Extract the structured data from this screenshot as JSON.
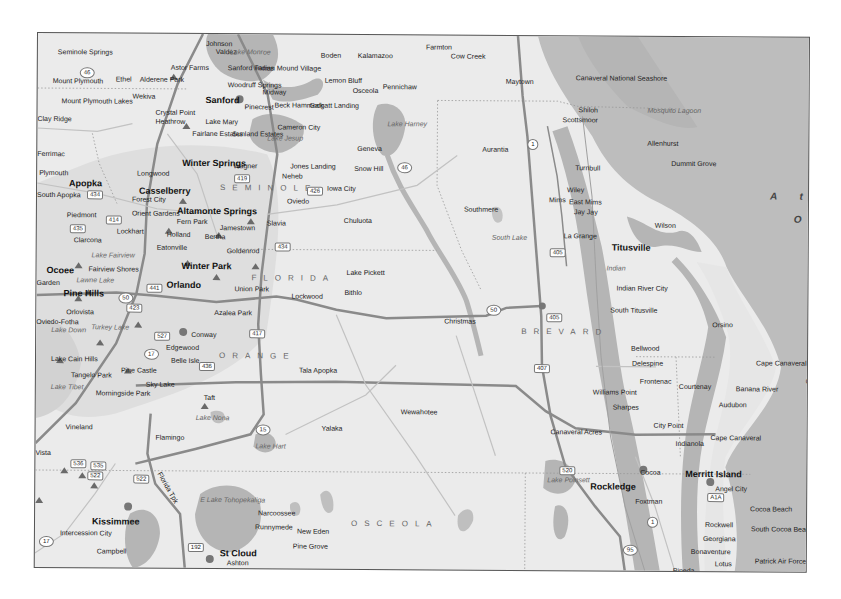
{
  "map": {
    "state_label": "FLORIDA",
    "counties": [
      {
        "name": "SEMINOLE",
        "x": 183,
        "y": 150
      },
      {
        "name": "ORANGE",
        "x": 183,
        "y": 318
      },
      {
        "name": "OSCEOLA",
        "x": 316,
        "y": 485
      },
      {
        "name": "BREVARD",
        "x": 485,
        "y": 292
      }
    ],
    "ocean_labels": [
      {
        "text": "A t l",
        "x": 733,
        "y": 155
      },
      {
        "text": "O",
        "x": 757,
        "y": 178
      }
    ],
    "cities": [
      {
        "name": "Seminole Springs",
        "x": 20,
        "y": 15,
        "bold": false
      },
      {
        "name": "Johnson",
        "x": 168,
        "y": 6,
        "bold": false
      },
      {
        "name": "Valdez",
        "x": 178,
        "y": 14,
        "bold": false
      },
      {
        "name": "Astor Farms",
        "x": 133,
        "y": 30,
        "bold": false
      },
      {
        "name": "Sanford Farms",
        "x": 190,
        "y": 30,
        "bold": false
      },
      {
        "name": "Indian Mound Village",
        "x": 218,
        "y": 30,
        "bold": false
      },
      {
        "name": "Boden",
        "x": 283,
        "y": 17,
        "bold": false
      },
      {
        "name": "Kalamazoo",
        "x": 320,
        "y": 17,
        "bold": false
      },
      {
        "name": "Farmton",
        "x": 388,
        "y": 8,
        "bold": false
      },
      {
        "name": "Cow Creek",
        "x": 413,
        "y": 17,
        "bold": false
      },
      {
        "name": "Mount Plymouth",
        "x": 15,
        "y": 44,
        "bold": false
      },
      {
        "name": "Ethel",
        "x": 78,
        "y": 42,
        "bold": false
      },
      {
        "name": "Alderene Park",
        "x": 102,
        "y": 42,
        "bold": false
      },
      {
        "name": "Woodruff Springs",
        "x": 190,
        "y": 47,
        "bold": false
      },
      {
        "name": "Lemon Bluff",
        "x": 287,
        "y": 42,
        "bold": false
      },
      {
        "name": "Osceola",
        "x": 315,
        "y": 52,
        "bold": false
      },
      {
        "name": "Pennichaw",
        "x": 345,
        "y": 48,
        "bold": false
      },
      {
        "name": "Maytown",
        "x": 468,
        "y": 42,
        "bold": false
      },
      {
        "name": "Mount Plymouth Lakes",
        "x": 24,
        "y": 64,
        "bold": false
      },
      {
        "name": "Wekiva",
        "x": 95,
        "y": 59,
        "bold": false
      },
      {
        "name": "Sanford",
        "x": 168,
        "y": 61,
        "bold": true
      },
      {
        "name": "Midway",
        "x": 225,
        "y": 54,
        "bold": false
      },
      {
        "name": "Pinecrest",
        "x": 207,
        "y": 69,
        "bold": false
      },
      {
        "name": "Beck Hammock",
        "x": 237,
        "y": 67,
        "bold": false
      },
      {
        "name": "Galgatt Landing",
        "x": 272,
        "y": 67,
        "bold": false
      },
      {
        "name": "Canaveral National Seashore",
        "x": 538,
        "y": 38,
        "bold": false
      },
      {
        "name": "Shiloh",
        "x": 541,
        "y": 70,
        "bold": false
      },
      {
        "name": "Scottsmoor",
        "x": 525,
        "y": 80,
        "bold": false
      },
      {
        "name": "Clay Ridge",
        "x": 0,
        "y": 82,
        "bold": false
      },
      {
        "name": "Crystal Point",
        "x": 118,
        "y": 75,
        "bold": false
      },
      {
        "name": "Heathrow",
        "x": 118,
        "y": 84,
        "bold": false
      },
      {
        "name": "Lake Mary",
        "x": 168,
        "y": 84,
        "bold": false
      },
      {
        "name": "Cameron City",
        "x": 240,
        "y": 89,
        "bold": false
      },
      {
        "name": "Fairlane Estates",
        "x": 155,
        "y": 96,
        "bold": false
      },
      {
        "name": "Sunland Estates",
        "x": 195,
        "y": 96,
        "bold": false
      },
      {
        "name": "Geneva",
        "x": 320,
        "y": 110,
        "bold": false
      },
      {
        "name": "Aurantia",
        "x": 445,
        "y": 110,
        "bold": false
      },
      {
        "name": "Allenhurst",
        "x": 610,
        "y": 103,
        "bold": false
      },
      {
        "name": "Dummit Grove",
        "x": 634,
        "y": 123,
        "bold": false
      },
      {
        "name": "Ferrimac",
        "x": 0,
        "y": 117,
        "bold": false
      },
      {
        "name": "Winter Springs",
        "x": 145,
        "y": 124,
        "bold": true
      },
      {
        "name": "Wagner",
        "x": 196,
        "y": 128,
        "bold": false
      },
      {
        "name": "Jones Landing",
        "x": 253,
        "y": 128,
        "bold": false
      },
      {
        "name": "Snow Hill",
        "x": 317,
        "y": 130,
        "bold": false
      },
      {
        "name": "Turnbull",
        "x": 538,
        "y": 128,
        "bold": false
      },
      {
        "name": "Plymouth",
        "x": 2,
        "y": 136,
        "bold": false
      },
      {
        "name": "Longwood",
        "x": 100,
        "y": 136,
        "bold": false
      },
      {
        "name": "Neheb",
        "x": 245,
        "y": 138,
        "bold": false
      },
      {
        "name": "Iowa City",
        "x": 290,
        "y": 150,
        "bold": false
      },
      {
        "name": "Apopka",
        "x": 32,
        "y": 145,
        "bold": true
      },
      {
        "name": "Casselberry",
        "x": 102,
        "y": 152,
        "bold": true
      },
      {
        "name": "South Apopka",
        "x": 0,
        "y": 158,
        "bold": false
      },
      {
        "name": "Forest City",
        "x": 95,
        "y": 162,
        "bold": false
      },
      {
        "name": "Oviedo",
        "x": 250,
        "y": 163,
        "bold": false
      },
      {
        "name": "Chuluota",
        "x": 307,
        "y": 182,
        "bold": false
      },
      {
        "name": "Mims",
        "x": 512,
        "y": 160,
        "bold": false
      },
      {
        "name": "Wiley",
        "x": 530,
        "y": 150,
        "bold": false
      },
      {
        "name": "East Mims",
        "x": 532,
        "y": 162,
        "bold": false
      },
      {
        "name": "Jay Jay",
        "x": 537,
        "y": 172,
        "bold": false
      },
      {
        "name": "Wilson",
        "x": 618,
        "y": 185,
        "bold": false
      },
      {
        "name": "Southmere",
        "x": 427,
        "y": 170,
        "bold": false
      },
      {
        "name": "Altamonte Springs",
        "x": 140,
        "y": 172,
        "bold": true
      },
      {
        "name": "Orient Gardens",
        "x": 95,
        "y": 176,
        "bold": false
      },
      {
        "name": "Piedmont",
        "x": 30,
        "y": 178,
        "bold": false
      },
      {
        "name": "Fern Park",
        "x": 140,
        "y": 184,
        "bold": false
      },
      {
        "name": "Jamestown",
        "x": 183,
        "y": 190,
        "bold": false
      },
      {
        "name": "Slavia",
        "x": 230,
        "y": 185,
        "bold": false
      },
      {
        "name": "La Grange",
        "x": 527,
        "y": 196,
        "bold": false
      },
      {
        "name": "Titusville",
        "x": 575,
        "y": 206,
        "bold": true
      },
      {
        "name": "Lockhart",
        "x": 80,
        "y": 194,
        "bold": false
      },
      {
        "name": "Holland",
        "x": 130,
        "y": 197,
        "bold": false
      },
      {
        "name": "Bertha",
        "x": 168,
        "y": 199,
        "bold": false
      },
      {
        "name": "Clarcona",
        "x": 37,
        "y": 203,
        "bold": false
      },
      {
        "name": "Eatonville",
        "x": 120,
        "y": 210,
        "bold": false
      },
      {
        "name": "Goldenrod",
        "x": 190,
        "y": 213,
        "bold": false
      },
      {
        "name": "Winter Park",
        "x": 145,
        "y": 227,
        "bold": true
      },
      {
        "name": "Ocoee",
        "x": 10,
        "y": 232,
        "bold": true
      },
      {
        "name": "Fairview Shores",
        "x": 52,
        "y": 232,
        "bold": false
      },
      {
        "name": "Lake Pickett",
        "x": 310,
        "y": 234,
        "bold": false
      },
      {
        "name": "Indian River City",
        "x": 580,
        "y": 248,
        "bold": false
      },
      {
        "name": "Garden",
        "x": 0,
        "y": 246,
        "bold": false
      },
      {
        "name": "Orlando",
        "x": 130,
        "y": 246,
        "bold": true
      },
      {
        "name": "Union Park",
        "x": 198,
        "y": 251,
        "bold": false
      },
      {
        "name": "Bithlo",
        "x": 308,
        "y": 254,
        "bold": false
      },
      {
        "name": "Pine Hills",
        "x": 27,
        "y": 255,
        "bold": true
      },
      {
        "name": "Lockwood",
        "x": 255,
        "y": 258,
        "bold": false
      },
      {
        "name": "South Titusville",
        "x": 574,
        "y": 270,
        "bold": false
      },
      {
        "name": "Christmas",
        "x": 408,
        "y": 282,
        "bold": false
      },
      {
        "name": "Orlovista",
        "x": 30,
        "y": 275,
        "bold": false
      },
      {
        "name": "Azalea Park",
        "x": 178,
        "y": 275,
        "bold": false
      },
      {
        "name": "Oviedo-Fotha",
        "x": 0,
        "y": 285,
        "bold": false
      },
      {
        "name": "Orsino",
        "x": 676,
        "y": 284,
        "bold": false
      },
      {
        "name": "Conway",
        "x": 155,
        "y": 297,
        "bold": false
      },
      {
        "name": "Bellwood",
        "x": 595,
        "y": 308,
        "bold": false
      },
      {
        "name": "Edgewood",
        "x": 130,
        "y": 310,
        "bold": false
      },
      {
        "name": "Lake Cain Hills",
        "x": 15,
        "y": 322,
        "bold": false
      },
      {
        "name": "Delespine",
        "x": 596,
        "y": 323,
        "bold": false
      },
      {
        "name": "Belle Isle",
        "x": 135,
        "y": 323,
        "bold": false
      },
      {
        "name": "Pine Castle",
        "x": 85,
        "y": 333,
        "bold": false
      },
      {
        "name": "Tala Apopka",
        "x": 263,
        "y": 332,
        "bold": false
      },
      {
        "name": "Cape Canaveral Air Force Station",
        "x": 720,
        "y": 322,
        "bold": false
      },
      {
        "name": "Canaveral",
        "x": 770,
        "y": 340,
        "bold": false
      },
      {
        "name": "Frontenac",
        "x": 604,
        "y": 341,
        "bold": false
      },
      {
        "name": "Courtenay",
        "x": 643,
        "y": 346,
        "bold": false
      },
      {
        "name": "Tangelo Park",
        "x": 35,
        "y": 338,
        "bold": false
      },
      {
        "name": "Sky Lake",
        "x": 110,
        "y": 347,
        "bold": false
      },
      {
        "name": "Williams Point",
        "x": 557,
        "y": 352,
        "bold": false
      },
      {
        "name": "Banana River",
        "x": 700,
        "y": 348,
        "bold": false
      },
      {
        "name": "Audubon",
        "x": 683,
        "y": 364,
        "bold": false
      },
      {
        "name": "Sharpes",
        "x": 577,
        "y": 367,
        "bold": false
      },
      {
        "name": "Morningside Park",
        "x": 60,
        "y": 356,
        "bold": false
      },
      {
        "name": "Taft",
        "x": 168,
        "y": 360,
        "bold": false
      },
      {
        "name": "Wewahotee",
        "x": 365,
        "y": 373,
        "bold": false
      },
      {
        "name": "City Point",
        "x": 618,
        "y": 385,
        "bold": false
      },
      {
        "name": "Canaveral Acres",
        "x": 515,
        "y": 392,
        "bold": false
      },
      {
        "name": "Yalaka",
        "x": 286,
        "y": 390,
        "bold": false
      },
      {
        "name": "Vineland",
        "x": 30,
        "y": 390,
        "bold": false
      },
      {
        "name": "Flamingo",
        "x": 120,
        "y": 400,
        "bold": false
      },
      {
        "name": "Indianola",
        "x": 640,
        "y": 403,
        "bold": false
      },
      {
        "name": "Cape Canaveral",
        "x": 675,
        "y": 397,
        "bold": false
      },
      {
        "name": "Vista",
        "x": 0,
        "y": 416,
        "bold": false
      },
      {
        "name": "Merritt Island",
        "x": 650,
        "y": 432,
        "bold": true
      },
      {
        "name": "Cocoa",
        "x": 605,
        "y": 432,
        "bold": false
      },
      {
        "name": "Rockledge",
        "x": 555,
        "y": 445,
        "bold": true
      },
      {
        "name": "Angel City",
        "x": 680,
        "y": 448,
        "bold": false
      },
      {
        "name": "Cocoa Beach",
        "x": 715,
        "y": 468,
        "bold": false
      },
      {
        "name": "Foxtman",
        "x": 600,
        "y": 461,
        "bold": false
      },
      {
        "name": "Narcoossee",
        "x": 223,
        "y": 475,
        "bold": false
      },
      {
        "name": "Rockwell",
        "x": 670,
        "y": 484,
        "bold": false
      },
      {
        "name": "South Cocoa Beach",
        "x": 716,
        "y": 488,
        "bold": false
      },
      {
        "name": "Runnymede",
        "x": 220,
        "y": 489,
        "bold": false
      },
      {
        "name": "New Eden",
        "x": 262,
        "y": 493,
        "bold": false
      },
      {
        "name": "Kissimmee",
        "x": 57,
        "y": 483,
        "bold": true
      },
      {
        "name": "Georgiana",
        "x": 668,
        "y": 498,
        "bold": false
      },
      {
        "name": "Intercession City",
        "x": 25,
        "y": 496,
        "bold": false
      },
      {
        "name": "Pine Grove",
        "x": 258,
        "y": 508,
        "bold": false
      },
      {
        "name": "Bonaventure",
        "x": 656,
        "y": 511,
        "bold": false
      },
      {
        "name": "Patrick Air Force Base",
        "x": 720,
        "y": 520,
        "bold": false
      },
      {
        "name": "Campbell",
        "x": 62,
        "y": 514,
        "bold": false
      },
      {
        "name": "St Cloud",
        "x": 185,
        "y": 514,
        "bold": true
      },
      {
        "name": "Lotus",
        "x": 680,
        "y": 523,
        "bold": false
      },
      {
        "name": "Ashton",
        "x": 192,
        "y": 525,
        "bold": false
      },
      {
        "name": "Pineda",
        "x": 638,
        "y": 530,
        "bold": false
      }
    ],
    "water_labels": [
      {
        "name": "Lake Monroe",
        "x": 192,
        "y": 14
      },
      {
        "name": "Mosquito Lagoon",
        "x": 610,
        "y": 70
      },
      {
        "name": "Lake Harney",
        "x": 350,
        "y": 85
      },
      {
        "name": "Lake Jesup",
        "x": 230,
        "y": 100
      },
      {
        "name": "South Lake",
        "x": 455,
        "y": 198
      },
      {
        "name": "Lake Fairview",
        "x": 55,
        "y": 218
      },
      {
        "name": "Lawne Lake",
        "x": 40,
        "y": 243
      },
      {
        "name": "Indian",
        "x": 570,
        "y": 228
      },
      {
        "name": "Turkey Lake",
        "x": 55,
        "y": 290
      },
      {
        "name": "Lake Down",
        "x": 15,
        "y": 293
      },
      {
        "name": "Lake Tibet",
        "x": 15,
        "y": 350
      },
      {
        "name": "Lake Nona",
        "x": 160,
        "y": 380
      },
      {
        "name": "Lake Hart",
        "x": 220,
        "y": 408
      },
      {
        "name": "E Lake Tohopekaliga",
        "x": 165,
        "y": 462
      },
      {
        "name": "Lake Poinsett",
        "x": 512,
        "y": 440
      }
    ],
    "route_shields": [
      {
        "num": "46",
        "x": 42,
        "y": 34
      },
      {
        "num": "419",
        "x": 197,
        "y": 140
      },
      {
        "name": "426",
        "num": "426",
        "x": 270,
        "y": 152
      },
      {
        "num": "46",
        "x": 360,
        "y": 127
      },
      {
        "num": "1",
        "x": 490,
        "y": 103
      },
      {
        "num": "434",
        "x": 50,
        "y": 157
      },
      {
        "num": "414",
        "x": 69,
        "y": 182
      },
      {
        "num": "435",
        "x": 33,
        "y": 191
      },
      {
        "num": "434",
        "x": 238,
        "y": 208
      },
      {
        "num": "405",
        "x": 513,
        "y": 212
      },
      {
        "num": "441",
        "x": 110,
        "y": 250
      },
      {
        "num": "50",
        "x": 82,
        "y": 259
      },
      {
        "num": "423",
        "x": 90,
        "y": 270
      },
      {
        "num": "417",
        "x": 213,
        "y": 295
      },
      {
        "num": "50",
        "x": 450,
        "y": 269
      },
      {
        "num": "405",
        "x": 510,
        "y": 277
      },
      {
        "num": "527",
        "x": 118,
        "y": 298
      },
      {
        "num": "17",
        "x": 108,
        "y": 315
      },
      {
        "num": "436",
        "x": 163,
        "y": 328
      },
      {
        "num": "407",
        "x": 498,
        "y": 328
      },
      {
        "num": "15",
        "x": 220,
        "y": 390
      },
      {
        "num": "536",
        "x": 35,
        "y": 426
      },
      {
        "num": "535",
        "x": 55,
        "y": 428
      },
      {
        "num": "522",
        "x": 52,
        "y": 438
      },
      {
        "num": "522",
        "x": 98,
        "y": 441
      },
      {
        "num": "520",
        "x": 524,
        "y": 430
      },
      {
        "num": "A1A",
        "x": 672,
        "y": 456
      },
      {
        "num": "1",
        "x": 612,
        "y": 480
      },
      {
        "num": "17",
        "x": 4,
        "y": 503
      },
      {
        "num": "192",
        "x": 153,
        "y": 509
      },
      {
        "num": "95",
        "x": 588,
        "y": 508
      }
    ],
    "road_labels": [
      {
        "text": "Florida Tpk",
        "x": 115,
        "y": 450
      }
    ],
    "colors": {
      "land": "#ebebeb",
      "water": "#b5b5b5",
      "ocean": "#bdbdbd",
      "urban": "#d4d4d4",
      "road_major": "#8a8a8a",
      "road_minor": "#c2c2c2",
      "boundary": "#999999"
    }
  }
}
